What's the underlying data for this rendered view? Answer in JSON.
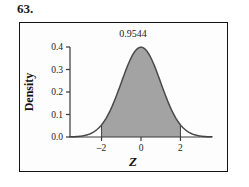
{
  "problem": {
    "number": "63."
  },
  "figure": {
    "annotation": "0.9544",
    "x_axis_title": "Z",
    "y_axis_title": "Density",
    "frame_color": "#141414",
    "fill_color": "#a3a3a3",
    "curve_color": "#4a4a4a"
  },
  "chart_data": {
    "type": "area",
    "title": "",
    "xlabel": "Z",
    "ylabel": "Density",
    "xlim": [
      -3.6,
      3.6
    ],
    "ylim": [
      0.0,
      0.4
    ],
    "xticks": [
      -2,
      0,
      2
    ],
    "xticklabels": [
      "–2",
      "0",
      "2"
    ],
    "yticks": [
      0.0,
      0.1,
      0.2,
      0.3,
      0.4
    ],
    "yticklabels": [
      "0.0",
      "0.1",
      "0.2",
      "0.3",
      "0.4"
    ],
    "grid": false,
    "legend": null,
    "distribution": "standard normal",
    "mean": 0,
    "sd": 1,
    "shaded_region": {
      "from": -2,
      "to": 2,
      "area": 0.9544,
      "label": "0.9544"
    },
    "annotations": [
      {
        "text": "0.9544",
        "x": 0,
        "y": 0.4,
        "position": "above-peak"
      }
    ],
    "x": [
      -3.6,
      -3.4,
      -3.2,
      -3.0,
      -2.8,
      -2.6,
      -2.4,
      -2.2,
      -2.0,
      -1.8,
      -1.6,
      -1.4,
      -1.2,
      -1.0,
      -0.8,
      -0.6,
      -0.4,
      -0.2,
      0.0,
      0.2,
      0.4,
      0.6,
      0.8,
      1.0,
      1.2,
      1.4,
      1.6,
      1.8,
      2.0,
      2.2,
      2.4,
      2.6,
      2.8,
      3.0,
      3.2,
      3.4,
      3.6
    ],
    "y": [
      0.0006,
      0.0012,
      0.0024,
      0.0044,
      0.0079,
      0.0136,
      0.0224,
      0.0355,
      0.054,
      0.079,
      0.1109,
      0.1497,
      0.1942,
      0.242,
      0.2897,
      0.3332,
      0.3683,
      0.391,
      0.3989,
      0.391,
      0.3683,
      0.3332,
      0.2897,
      0.242,
      0.1942,
      0.1497,
      0.1109,
      0.079,
      0.054,
      0.0355,
      0.0224,
      0.0136,
      0.0079,
      0.0044,
      0.0024,
      0.0012,
      0.0006
    ]
  }
}
